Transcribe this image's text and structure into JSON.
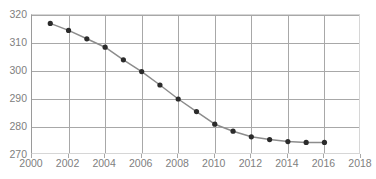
{
  "chart_data": {
    "type": "line",
    "title": "",
    "subtitle": "",
    "xlabel": "",
    "ylabel": "",
    "x": [
      2001,
      2002,
      2003,
      2004,
      2005,
      2006,
      2007,
      2008,
      2009,
      2010,
      2011,
      2012,
      2013,
      2014,
      2015,
      2016
    ],
    "values": [
      317.0,
      314.5,
      311.5,
      308.5,
      304.0,
      299.8,
      295.0,
      290.0,
      285.5,
      281.0,
      278.5,
      276.5,
      275.5,
      274.8,
      274.5,
      274.5
    ],
    "series": [
      {
        "name": "",
        "values": [
          317.0,
          314.5,
          311.5,
          308.5,
          304.0,
          299.8,
          295.0,
          290.0,
          285.5,
          281.0,
          278.5,
          276.5,
          275.5,
          274.8,
          274.5,
          274.5
        ]
      }
    ],
    "xlim": [
      2000,
      2018
    ],
    "ylim": [
      270,
      320
    ],
    "xticks": [
      2000,
      2002,
      2004,
      2006,
      2008,
      2010,
      2012,
      2014,
      2016,
      2018
    ],
    "xtick_labels": [
      "2000",
      "2002",
      "2004",
      "2006",
      "2008",
      "2010",
      "2012",
      "2014",
      "2016",
      "2018"
    ],
    "yticks": [
      270,
      280,
      290,
      300,
      310,
      320
    ],
    "ytick_labels": [
      "270",
      "280",
      "290",
      "300",
      "310",
      "320"
    ],
    "grid": true,
    "grid_x": true,
    "grid_y": true,
    "legend": false,
    "legend_position": "none",
    "marker": "circle",
    "annotations": [],
    "colors": {
      "line": "#8c8c8c",
      "marker": "#2b2b2b",
      "grid": "#a8a8a8",
      "axis": "#9a9a9a",
      "tick_label": "#808080",
      "background": "#ffffff",
      "plot_border": "#d6d6d6"
    }
  }
}
